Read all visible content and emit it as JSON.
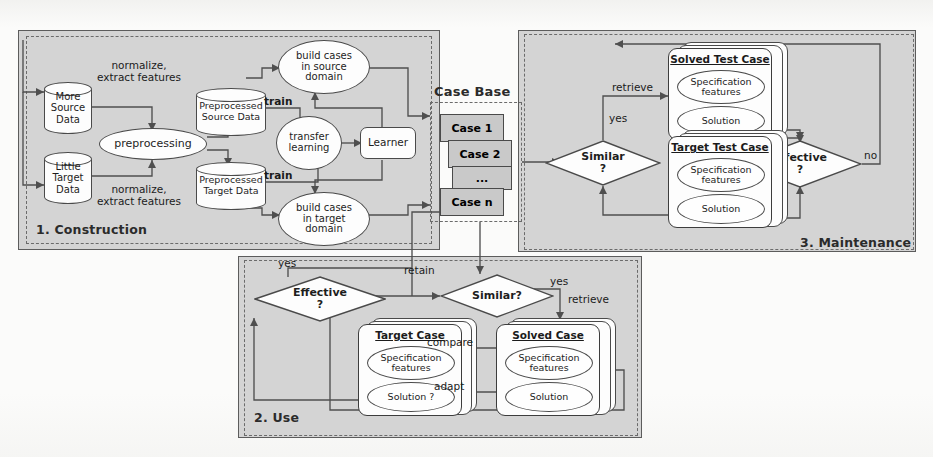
{
  "figure": {
    "regions": [
      {
        "id": "construction",
        "label": "1. Construction"
      },
      {
        "id": "use",
        "label": "2. Use"
      },
      {
        "id": "maintenance",
        "label": "3. Maintenance"
      }
    ],
    "case_base": {
      "title": "Case Base",
      "cases": [
        "Case 1",
        "Case 2",
        "...",
        "Case n"
      ]
    },
    "construction": {
      "source_db": [
        "More",
        "Source",
        "Data"
      ],
      "target_db": [
        "Little",
        "Target",
        "Data"
      ],
      "preprocessing": "preprocessing",
      "preprocessed_source": [
        "Preprocessed",
        "Source Data"
      ],
      "preprocessed_target": [
        "Preprocessed",
        "Target Data"
      ],
      "build_source": [
        "build cases",
        "in source",
        "domain"
      ],
      "build_target": [
        "build cases",
        "in target",
        "domain"
      ],
      "transfer_learning": [
        "transfer",
        "learning"
      ],
      "learner": "Learner",
      "edge_labels": {
        "normalize_top": [
          "normalize,",
          "extract features"
        ],
        "normalize_bottom": [
          "normalize,",
          "extract features"
        ],
        "train_top": "train",
        "train_bottom": "train"
      }
    },
    "use": {
      "effective": [
        "Effective",
        "?"
      ],
      "similar": "Similar?",
      "target_case": {
        "title": "Target Case",
        "spec": [
          "Specification",
          "features"
        ],
        "solution": "Solution ?"
      },
      "solved_case": {
        "title": "Solved Case",
        "spec": [
          "Specification",
          "features"
        ],
        "solution": "Solution"
      },
      "edge_labels": {
        "yes_left": "yes",
        "retain": "retain",
        "yes_right": "yes",
        "retrieve": "retrieve",
        "compare": "compare",
        "adapt": "adapt"
      }
    },
    "maintenance": {
      "similar": [
        "Similar",
        "?"
      ],
      "effective": [
        "Effective",
        "?"
      ],
      "solved_test_case": {
        "title": "Solved Test Case",
        "spec": [
          "Specification",
          "features"
        ],
        "solution": "Solution"
      },
      "target_test_case": {
        "title": "Target Test Case",
        "spec": [
          "Specification",
          "features"
        ],
        "solution": "Solution"
      },
      "edge_labels": {
        "retrieve": "retrieve",
        "yes": "yes",
        "no": "no"
      }
    },
    "colors": {
      "shade": "#d4d4d4",
      "case_fill": "#c9c9c9",
      "node_fill": "#fdfdfd",
      "stroke": "#4a4a4a",
      "page": "#fbfbfa"
    }
  }
}
